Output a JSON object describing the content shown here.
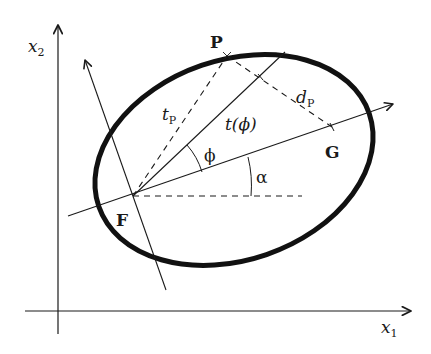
{
  "figure": {
    "colors": {
      "stroke": "#1a1a1a",
      "background": "#ffffff"
    }
  },
  "axes": {
    "x1_label": "x",
    "x1_sub": "1",
    "x2_label": "x",
    "x2_sub": "2"
  },
  "points": {
    "focus": "F",
    "point_p": "P",
    "point_g": "G"
  },
  "labels": {
    "t_p": "t",
    "t_p_sub": "P",
    "t_phi": "t(ϕ)",
    "d_p": "d",
    "d_p_sub": "P",
    "phi": "ϕ",
    "alpha": "α"
  }
}
